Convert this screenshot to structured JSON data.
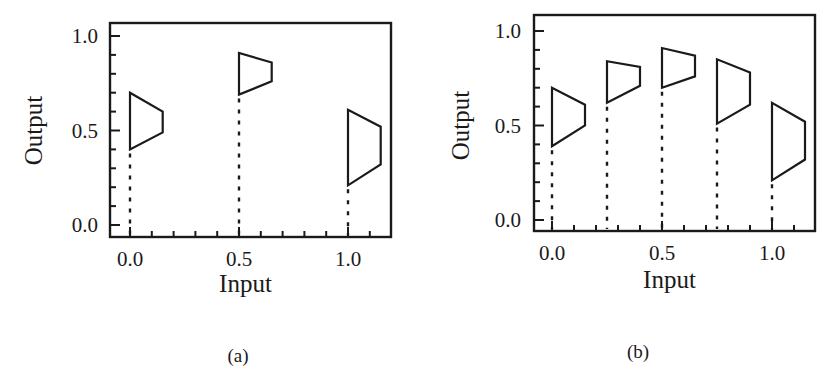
{
  "figure": {
    "captions": [
      "(a)",
      "(b)"
    ]
  },
  "chart_data": [
    {
      "type": "scatter",
      "panel": "(a)",
      "title": "",
      "xlabel": "Input",
      "ylabel": "Output",
      "xlim": [
        -0.05,
        1.2
      ],
      "ylim": [
        -0.06,
        1.08
      ],
      "x_ticks": [
        "0.0",
        "0.5",
        "1.0"
      ],
      "y_ticks": [
        "0.0",
        "0.5",
        "1.0"
      ],
      "x_minor_step": 0.1,
      "y_minor_step": 0.1,
      "grid": false,
      "legend": null,
      "marker": "trapezoid interval glyph (left edge = output range at input, right edge narrower) with dotted drop-line to x-axis",
      "glyph_width": 0.15,
      "points": [
        {
          "x": 0.0,
          "left": [
            0.4,
            0.7
          ],
          "right": [
            0.49,
            0.6
          ]
        },
        {
          "x": 0.5,
          "left": [
            0.69,
            0.91
          ],
          "right": [
            0.76,
            0.86
          ]
        },
        {
          "x": 1.0,
          "left": [
            0.21,
            0.61
          ],
          "right": [
            0.32,
            0.52
          ]
        }
      ]
    },
    {
      "type": "scatter",
      "panel": "(b)",
      "title": "",
      "xlabel": "Input",
      "ylabel": "Output",
      "xlim": [
        -0.08,
        1.2
      ],
      "ylim": [
        -0.06,
        1.08
      ],
      "x_ticks": [
        "0.0",
        "0.5",
        "1.0"
      ],
      "y_ticks": [
        "0.0",
        "0.5",
        "1.0"
      ],
      "x_minor_step": 0.1,
      "y_minor_step": 0.1,
      "grid": false,
      "legend": null,
      "marker": "trapezoid interval glyph (left edge = output range at input, right edge narrower) with dotted drop-line to x-axis",
      "glyph_width": 0.15,
      "points": [
        {
          "x": 0.0,
          "left": [
            0.39,
            0.7
          ],
          "right": [
            0.5,
            0.61
          ]
        },
        {
          "x": 0.25,
          "left": [
            0.62,
            0.84
          ],
          "right": [
            0.71,
            0.81
          ]
        },
        {
          "x": 0.5,
          "left": [
            0.7,
            0.91
          ],
          "right": [
            0.76,
            0.87
          ]
        },
        {
          "x": 0.75,
          "left": [
            0.51,
            0.85
          ],
          "right": [
            0.61,
            0.78
          ]
        },
        {
          "x": 1.0,
          "left": [
            0.21,
            0.62
          ],
          "right": [
            0.32,
            0.52
          ]
        }
      ]
    }
  ]
}
